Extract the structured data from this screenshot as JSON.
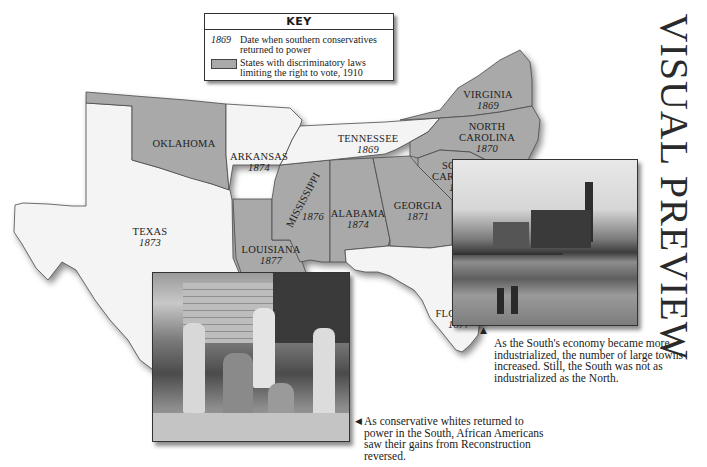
{
  "title": "VISUAL PREVIEW",
  "key": {
    "heading": "KEY",
    "year_sample": "1869",
    "year_desc": "Date when southern conservatives returned to power",
    "swatch_desc": "States with discriminatory laws limiting the right to vote, 1910",
    "swatch_color": "#a9a9a9"
  },
  "states": [
    {
      "name": "OKLAHOMA",
      "year": "",
      "discriminatory_laws_1910": true
    },
    {
      "name": "ARKANSAS",
      "year": "1874",
      "discriminatory_laws_1910": false
    },
    {
      "name": "TEXAS",
      "year": "1873",
      "discriminatory_laws_1910": false
    },
    {
      "name": "LOUISIANA",
      "year": "1877",
      "discriminatory_laws_1910": true
    },
    {
      "name": "MISSISSIPPI",
      "year": "1876",
      "discriminatory_laws_1910": true
    },
    {
      "name": "ALABAMA",
      "year": "1874",
      "discriminatory_laws_1910": true
    },
    {
      "name": "GEORGIA",
      "year": "1871",
      "discriminatory_laws_1910": true
    },
    {
      "name": "TENNESSEE",
      "year": "1869",
      "discriminatory_laws_1910": false
    },
    {
      "name": "VIRGINIA",
      "year": "1869",
      "discriminatory_laws_1910": true
    },
    {
      "name": "NORTH CAROLINA",
      "year": "1870",
      "discriminatory_laws_1910": true
    },
    {
      "name": "SOUTH CAROLINA",
      "year": "1877",
      "discriminatory_laws_1910": true
    },
    {
      "name": "FLORIDA",
      "year": "1877",
      "discriminatory_laws_1910": false
    }
  ],
  "captions": {
    "industry": "As the South's economy became more industrialized, the number of large towns increased. Still, the South was not as industrialized as the North.",
    "family": "As conservative whites returned to power in the South, African Americans saw their gains from Reconstruction reversed."
  },
  "pointers": {
    "up": "▲",
    "left": "◀"
  },
  "photos": {
    "industry": "industrial town photograph",
    "family": "African American family photograph"
  },
  "colors": {
    "gray_state": "#a9a9a9",
    "white_state": "#f4f4f4",
    "border": "#4a4a4a"
  }
}
